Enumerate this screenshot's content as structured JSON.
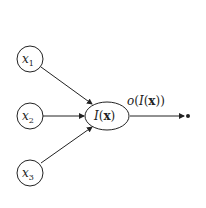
{
  "diagram": {
    "type": "perceptron-neuron",
    "inputs": [
      {
        "id": "x1",
        "var": "x",
        "sub": "1"
      },
      {
        "id": "x2",
        "var": "x",
        "sub": "2"
      },
      {
        "id": "x3",
        "var": "x",
        "sub": "3"
      }
    ],
    "neuron": {
      "func": "I",
      "open": "(",
      "arg": "x",
      "close": ")"
    },
    "output": {
      "label_outer": "o",
      "label_open": "(",
      "func": "I",
      "arg": "x",
      "label_close": "))"
    },
    "colors": {
      "stroke": "#222222",
      "background": "#ffffff"
    }
  }
}
